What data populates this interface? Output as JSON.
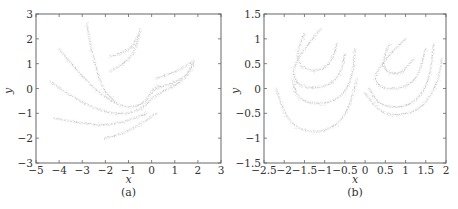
{
  "chart_data": [
    {
      "type": "scatter",
      "panel": "(a)",
      "caption": "(a)",
      "title": "",
      "xlabel": "x",
      "ylabel": "y",
      "xlim": [
        -5,
        3
      ],
      "ylim": [
        -3,
        3
      ],
      "xticks": [
        "−5",
        "−4",
        "−3",
        "−2",
        "−1",
        "0",
        "1",
        "2",
        "3"
      ],
      "yticks": [
        "−3",
        "−2",
        "−1",
        "0",
        "1",
        "2",
        "3"
      ],
      "grid": false,
      "legend": null,
      "description": "Dense gray point cloud forming fractal-like curved filaments (strange attractor); major arcs sweep from (-4.4,0.3) down to (0,-1) and up to (1.8,1.1); second lobe arcs from (-1.8,1.4) to (-0.5,2.4); spike near x=-2.7 reaching y=2.6; lower sparse arcs from (-4,-1.2) to (0,-1.3) and (-2,-2).",
      "curves": [
        {
          "points": [
            [
              -4.4,
              0.3
            ],
            [
              -3.5,
              -0.3
            ],
            [
              -2.5,
              -0.8
            ],
            [
              -1.5,
              -1.05
            ],
            [
              -0.5,
              -0.9
            ],
            [
              0,
              -0.4
            ],
            [
              0.5,
              -0.1
            ],
            [
              1.2,
              0.2
            ],
            [
              1.7,
              0.7
            ],
            [
              1.8,
              1.1
            ]
          ]
        },
        {
          "points": [
            [
              -4.0,
              1.6
            ],
            [
              -3.3,
              0.8
            ],
            [
              -2.5,
              0.0
            ],
            [
              -1.8,
              -0.5
            ],
            [
              -1.0,
              -0.8
            ],
            [
              -0.3,
              -0.6
            ],
            [
              0.0,
              -0.1
            ],
            [
              0.3,
              0.1
            ]
          ]
        },
        {
          "points": [
            [
              -4.2,
              -1.2
            ],
            [
              -3.0,
              -1.4
            ],
            [
              -2.0,
              -1.5
            ],
            [
              -1.0,
              -1.3
            ],
            [
              -0.2,
              -1.0
            ]
          ]
        },
        {
          "points": [
            [
              -2.0,
              -2.0
            ],
            [
              -1.2,
              -1.8
            ],
            [
              -0.4,
              -1.4
            ],
            [
              0.2,
              -1.0
            ]
          ]
        },
        {
          "points": [
            [
              -2.8,
              2.6
            ],
            [
              -2.6,
              1.5
            ],
            [
              -2.3,
              0.5
            ],
            [
              -2.0,
              -0.2
            ],
            [
              -1.6,
              -0.5
            ]
          ]
        },
        {
          "points": [
            [
              -1.8,
              1.3
            ],
            [
              -1.3,
              1.4
            ],
            [
              -0.8,
              1.7
            ],
            [
              -0.5,
              2.3
            ]
          ]
        },
        {
          "points": [
            [
              -1.8,
              0.7
            ],
            [
              -1.2,
              1.0
            ],
            [
              -0.7,
              1.5
            ],
            [
              -0.5,
              2.4
            ]
          ]
        },
        {
          "points": [
            [
              0.2,
              0.4
            ],
            [
              0.8,
              0.6
            ],
            [
              1.3,
              0.8
            ],
            [
              1.8,
              1.1
            ]
          ]
        },
        {
          "points": [
            [
              0.2,
              0.0
            ],
            [
              0.9,
              0.2
            ],
            [
              1.5,
              0.5
            ],
            [
              1.8,
              1.0
            ]
          ]
        }
      ]
    },
    {
      "type": "scatter",
      "panel": "(b)",
      "caption": "(b)",
      "title": "",
      "xlabel": "x",
      "ylabel": "y",
      "xlim": [
        -2.5,
        2
      ],
      "ylim": [
        -1.5,
        1.5
      ],
      "xticks": [
        "−2.5",
        "−2",
        "−1.5",
        "−1",
        "−0.5",
        "0",
        "0.5",
        "1",
        "1.5",
        "2"
      ],
      "yticks": [
        "−1.5",
        "−1",
        "−0.5",
        "0",
        "0.5",
        "1",
        "1.5"
      ],
      "grid": false,
      "legend": null,
      "description": "Two similar crescent-shaped attractor lobes made of nested gray arcs; left lobe spans x≈-2.2 to -0.2, y≈-0.95 to 1.2; right lobe spans x≈0 to 1.9, y≈-0.55 to 1.0.",
      "curves": [
        {
          "points": [
            [
              -1.5,
              1.1
            ],
            [
              -1.7,
              0.7
            ],
            [
              -1.6,
              0.45
            ],
            [
              -1.3,
              0.35
            ],
            [
              -1.0,
              0.4
            ],
            [
              -0.8,
              0.6
            ],
            [
              -0.7,
              0.9
            ]
          ]
        },
        {
          "points": [
            [
              -1.1,
              1.2
            ],
            [
              -1.5,
              0.8
            ],
            [
              -1.8,
              0.4
            ],
            [
              -1.7,
              0.1
            ],
            [
              -1.4,
              0.0
            ],
            [
              -0.9,
              0.05
            ],
            [
              -0.6,
              0.3
            ],
            [
              -0.5,
              0.7
            ]
          ]
        },
        {
          "points": [
            [
              -1.8,
              0.2
            ],
            [
              -1.7,
              -0.15
            ],
            [
              -1.4,
              -0.3
            ],
            [
              -0.9,
              -0.3
            ],
            [
              -0.5,
              -0.1
            ],
            [
              -0.3,
              0.3
            ],
            [
              -0.25,
              0.8
            ]
          ]
        },
        {
          "points": [
            [
              -2.2,
              0.0
            ],
            [
              -2.0,
              -0.5
            ],
            [
              -1.7,
              -0.8
            ],
            [
              -1.2,
              -0.9
            ],
            [
              -0.7,
              -0.75
            ],
            [
              -0.4,
              -0.4
            ],
            [
              -0.2,
              0.2
            ]
          ]
        },
        {
          "points": [
            [
              0.6,
              0.9
            ],
            [
              0.4,
              0.5
            ],
            [
              0.6,
              0.3
            ],
            [
              0.9,
              0.3
            ],
            [
              1.2,
              0.6
            ]
          ]
        },
        {
          "points": [
            [
              1.0,
              1.0
            ],
            [
              0.5,
              0.6
            ],
            [
              0.2,
              0.2
            ],
            [
              0.4,
              0.0
            ],
            [
              0.9,
              0.0
            ],
            [
              1.3,
              0.2
            ],
            [
              1.5,
              0.8
            ]
          ]
        },
        {
          "points": [
            [
              0.1,
              0.0
            ],
            [
              0.3,
              -0.3
            ],
            [
              0.8,
              -0.4
            ],
            [
              1.3,
              -0.25
            ],
            [
              1.6,
              0.2
            ],
            [
              1.7,
              0.9
            ]
          ]
        },
        {
          "points": [
            [
              0.0,
              -0.1
            ],
            [
              0.4,
              -0.5
            ],
            [
              0.9,
              -0.55
            ],
            [
              1.4,
              -0.4
            ],
            [
              1.8,
              0.1
            ],
            [
              1.9,
              0.6
            ]
          ]
        }
      ]
    }
  ]
}
